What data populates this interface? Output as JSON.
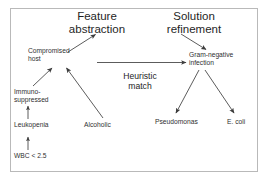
{
  "diagram": {
    "frame": {
      "border_color": "#b9b9b9",
      "background": "#ffffff"
    },
    "edge_color": "#4a4a4a",
    "nodes": [
      {
        "id": "feature-abstraction",
        "label": "Feature\nabstraction",
        "size": "big"
      },
      {
        "id": "solution-refinement",
        "label": "Solution\nrefinement",
        "size": "big"
      },
      {
        "id": "heuristic-match",
        "label": "Heuristic\nmatch",
        "size": "mid"
      },
      {
        "id": "compromised-host",
        "label": "Compromised\nhost",
        "size": "small"
      },
      {
        "id": "gram-negative",
        "label": "Gram-negative\ninfection",
        "size": "small"
      },
      {
        "id": "immuno-suppressed",
        "label": "Immuno-\nsuppressed",
        "size": "small"
      },
      {
        "id": "leukopenia",
        "label": "Leukopenia",
        "size": "small"
      },
      {
        "id": "wbc",
        "label": "WBC < 2.5",
        "size": "small"
      },
      {
        "id": "alcoholic",
        "label": "Alcoholic",
        "size": "small"
      },
      {
        "id": "pseudomonas",
        "label": "Pseudomonas",
        "size": "small"
      },
      {
        "id": "ecoli",
        "label": "E. coli",
        "size": "small"
      }
    ],
    "edges": [
      {
        "from": "compromised-host",
        "to": "feature-abstraction",
        "kind": "diagonal-up-right"
      },
      {
        "from": "solution-refinement",
        "to": "gram-negative",
        "kind": "diagonal-down-right"
      },
      {
        "from": "compromised-host",
        "to": "gram-negative",
        "kind": "horizontal",
        "label": "Heuristic match"
      },
      {
        "from": "immuno-suppressed",
        "to": "compromised-host",
        "kind": "diagonal-up-right"
      },
      {
        "from": "alcoholic",
        "to": "compromised-host",
        "kind": "diagonal-up-left"
      },
      {
        "from": "leukopenia",
        "to": "immuno-suppressed",
        "kind": "vertical-up"
      },
      {
        "from": "wbc",
        "to": "leukopenia",
        "kind": "vertical-up"
      },
      {
        "from": "gram-negative",
        "to": "pseudomonas",
        "kind": "diagonal-down-left"
      },
      {
        "from": "gram-negative",
        "to": "ecoli",
        "kind": "diagonal-down-right"
      }
    ]
  }
}
